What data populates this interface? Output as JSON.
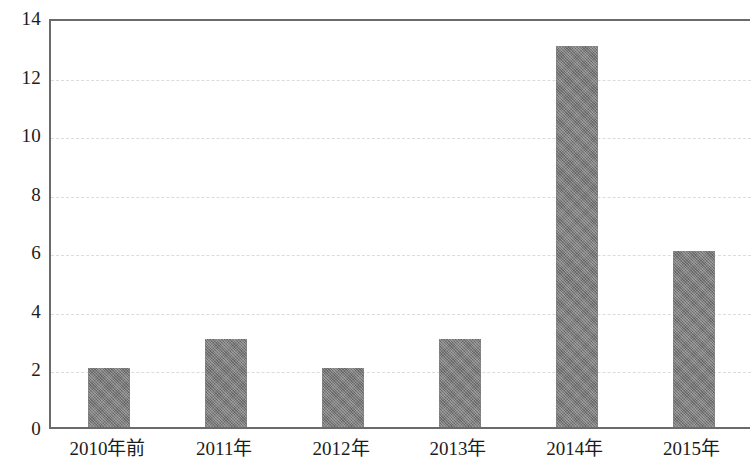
{
  "chart_data": {
    "type": "bar",
    "title": "",
    "subtitle": "",
    "xlabel": "",
    "ylabel": "",
    "categories": [
      "2010年前",
      "2011年",
      "2012年",
      "2013年",
      "2014年",
      "2015年"
    ],
    "values": [
      2,
      3,
      2,
      3,
      13,
      6
    ],
    "ylim": [
      0,
      14
    ],
    "ytick_labels": [
      "0",
      "2",
      "4",
      "6",
      "8",
      "10",
      "12",
      "14"
    ],
    "ytick_values": [
      0,
      2,
      4,
      6,
      8,
      10,
      12,
      14
    ],
    "ytick_step": 2,
    "grid": true,
    "grid_axis": "y",
    "grid_style": "dashed",
    "legend": false,
    "legend_position": "none",
    "bar_color": "#7c7c7c",
    "grid_color": "#dcdcdc",
    "axis_color": "#6b6b6b",
    "text_color": "#1c1c1c",
    "background_color": "#ffffff",
    "bar_width_ratio": 0.36,
    "series": [
      {
        "name": "",
        "values": [
          2,
          3,
          2,
          3,
          13,
          6
        ]
      }
    ],
    "annotations": []
  }
}
